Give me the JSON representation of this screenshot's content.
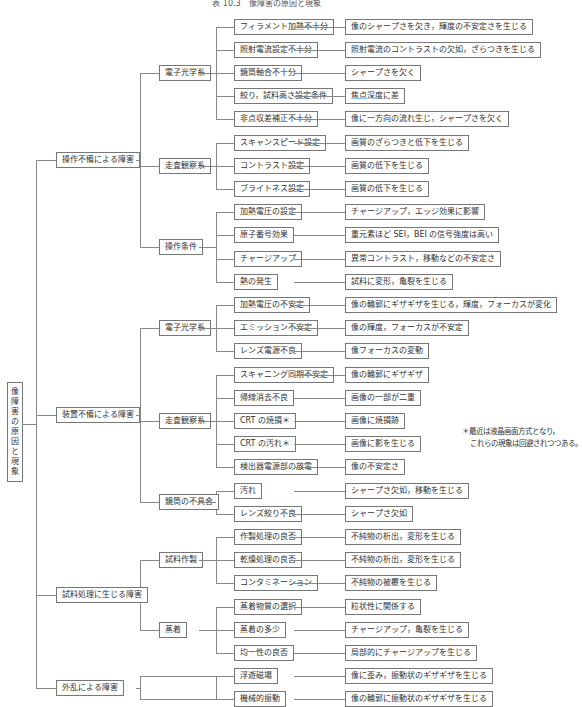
{
  "title": "表 10.3　像障害の原因と現象",
  "root": "像障害の原因と現象",
  "note": [
    "＊最近は液晶画面方式となり，",
    "これらの現象は回避されつつある。"
  ],
  "categories": [
    {
      "label": "操作不備による障害",
      "groups": [
        {
          "label": "電子光学系",
          "items": [
            {
              "cause": "フィラメント加熱不十分",
              "effect": "像のシャープさを欠き，輝度の不安定さを生じる"
            },
            {
              "cause": "照射電流設定不十分",
              "effect": "照射電流のコントラストの欠如，ざらつきを生じる"
            },
            {
              "cause": "鏡筒軸合不十分",
              "effect": "シャープさを欠く"
            },
            {
              "cause": "絞り，試料高さ設定条件",
              "effect": "焦点深度に差"
            },
            {
              "cause": "非点収差補正不十分",
              "effect": "像に一方向の流れ生じ，シャープさを欠く"
            }
          ]
        },
        {
          "label": "走査観察系",
          "items": [
            {
              "cause": "スキャンスピード設定",
              "effect": "画質のざらつきと低下を生じる"
            },
            {
              "cause": "コントラスト設定",
              "effect": "画質の低下を生じる"
            },
            {
              "cause": "ブライトネス設定",
              "effect": "画質の低下を生じる"
            }
          ]
        },
        {
          "label": "操作条件",
          "items": [
            {
              "cause": "加熱電圧の設定",
              "effect": "チャージアップ，エッジ効果に影響"
            },
            {
              "cause": "原子番号効果",
              "effect": "重元素ほど SEI，BEI の信号強度は高い"
            },
            {
              "cause": "チャージアップ",
              "effect": "異常コントラスト，移動などの不安定さ"
            },
            {
              "cause": "熱の発生",
              "effect": "試料に変形，亀裂を生じる"
            }
          ]
        }
      ]
    },
    {
      "label": "装置不備による障害",
      "groups": [
        {
          "label": "電子光学系",
          "items": [
            {
              "cause": "加熱電圧の不安定",
              "effect": "像の輪郭にギザギザを生じる，輝度，フォーカスが変化"
            },
            {
              "cause": "エミッション不安定",
              "effect": "像の輝度，フォーカスが不安定"
            },
            {
              "cause": "レンズ電源不良",
              "effect": "像フォーカスの変動"
            }
          ]
        },
        {
          "label": "走査観察系",
          "items": [
            {
              "cause": "スキャニング同期不安定",
              "effect": "像の輪郭にギザギザ"
            },
            {
              "cause": "帰線消去不良",
              "effect": "画像の一部が二重"
            },
            {
              "cause": "CRT の焼損＊",
              "effect": "画像に焼損跡"
            },
            {
              "cause": "CRT の汚れ＊",
              "effect": "画像に影を生じる"
            },
            {
              "cause": "検出器電源部の放電",
              "effect": "像の不安定さ"
            }
          ]
        },
        {
          "label": "鏡筒の不具合",
          "items": [
            {
              "cause": "汚れ",
              "effect": "シャープさ欠如，移動を生じる"
            },
            {
              "cause": "レンズ絞り不良",
              "effect": "シャープさ欠如"
            }
          ]
        }
      ]
    },
    {
      "label": "試料処理に生じる障害",
      "groups": [
        {
          "label": "試料作製",
          "items": [
            {
              "cause": "作製処理の良否",
              "effect": "不純物の析出，変形を生じる"
            },
            {
              "cause": "乾燥処理の良否",
              "effect": "不純物の析出，変形を生じる"
            },
            {
              "cause": "コンタミネーション",
              "effect": "不純物の被覆を生じる"
            }
          ]
        },
        {
          "label": "蒸着",
          "items": [
            {
              "cause": "蒸着物質の選択",
              "effect": "粒状性に関係する"
            },
            {
              "cause": "蒸着の多少",
              "effect": "チャージアップ，亀裂を生じる"
            },
            {
              "cause": "均一性の良否",
              "effect": "局部的にチャージアップを生じる"
            }
          ]
        }
      ]
    },
    {
      "label": "外乱による障害",
      "groups": [
        {
          "label": "",
          "items": [
            {
              "cause": "浮遊磁場",
              "effect": "像に歪み，振動状のギザギザを生じる"
            },
            {
              "cause": "機械的振動",
              "effect": "像の輪郭に振動状のギザギザを生じる"
            }
          ]
        }
      ]
    }
  ]
}
